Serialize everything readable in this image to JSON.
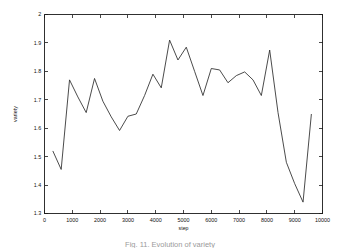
{
  "figure": {
    "background_color": "#ffffff",
    "line_color": "#2b2b2b",
    "axis_color": "#1a1a1a",
    "caption": "Fig. 11.  Evolution of variety"
  },
  "chart_data": {
    "type": "line",
    "title": "",
    "xlabel": "step",
    "ylabel": "variety",
    "xlim": [
      0,
      10000
    ],
    "ylim": [
      1.3,
      2.0
    ],
    "xticks": [
      0,
      1000,
      2000,
      3000,
      4000,
      5000,
      6000,
      7000,
      8000,
      9000,
      10000
    ],
    "xticklabels": [
      "0",
      "1000",
      "2000",
      "3000",
      "4000",
      "5000",
      "6000",
      "7000",
      "8000",
      "9000",
      "10000"
    ],
    "yticks": [
      1.3,
      1.4,
      1.5,
      1.6,
      1.7,
      1.8,
      1.9,
      2.0
    ],
    "yticklabels": [
      "1.3",
      "1.4",
      "1.5",
      "1.6",
      "1.7",
      "1.8",
      "1.9",
      "2"
    ],
    "grid": false,
    "legend": null,
    "markers": false,
    "series": [
      {
        "name": "variety",
        "color": "#2b2b2b",
        "x": [
          300,
          600,
          900,
          1200,
          1500,
          1800,
          2100,
          2400,
          2700,
          3000,
          3300,
          3600,
          3900,
          4200,
          4500,
          4800,
          5100,
          5400,
          5700,
          6000,
          6300,
          6600,
          6900,
          7200,
          7500,
          7800,
          8100,
          8400,
          8700,
          9000,
          9300,
          9600
        ],
        "y": [
          1.52,
          1.455,
          1.77,
          1.71,
          1.655,
          1.775,
          1.695,
          1.64,
          1.592,
          1.642,
          1.65,
          1.715,
          1.79,
          1.742,
          1.91,
          1.84,
          1.885,
          1.8,
          1.715,
          1.81,
          1.805,
          1.76,
          1.785,
          1.798,
          1.77,
          1.715,
          1.875,
          1.655,
          1.48,
          1.405,
          1.34,
          1.65
        ]
      }
    ]
  }
}
